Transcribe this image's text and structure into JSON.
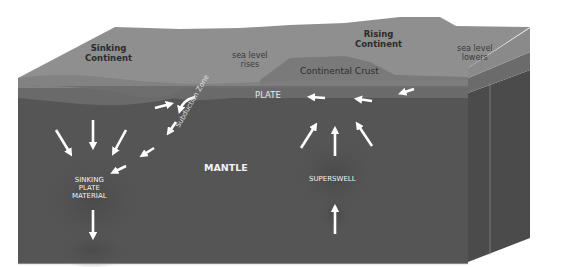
{
  "diagram": {
    "colors": {
      "background": "#ffffff",
      "top_surface": "#8e8e8e",
      "continental_crust": "#7c7c7c",
      "plate_layer": "#6c6c6c",
      "mantle_front": "#555555",
      "mantle_side": "#4a4a4a",
      "arrows": "#ffffff"
    },
    "labels": {
      "sinking_continent": [
        "Sinking",
        "Continent"
      ],
      "sea_level_rises": [
        "sea level",
        "rises"
      ],
      "rising_continent": [
        "Rising",
        "Continent"
      ],
      "sea_level_lowers": [
        "sea level",
        "lowers"
      ],
      "continental_crust": "Continental Crust",
      "plate": "PLATE",
      "subduction_zone": "Subduction Zone",
      "mantle": "MANTLE",
      "sinking_plate_material": [
        "SINKING",
        "PLATE",
        "MATERIAL"
      ],
      "superswell": "SUPERSWELL"
    },
    "arrows": {
      "plate_flow": "leftward toward subduction zone",
      "sinking": "converging down into sinking plate material",
      "superswell": "rising up from below and diverging under continent"
    }
  }
}
